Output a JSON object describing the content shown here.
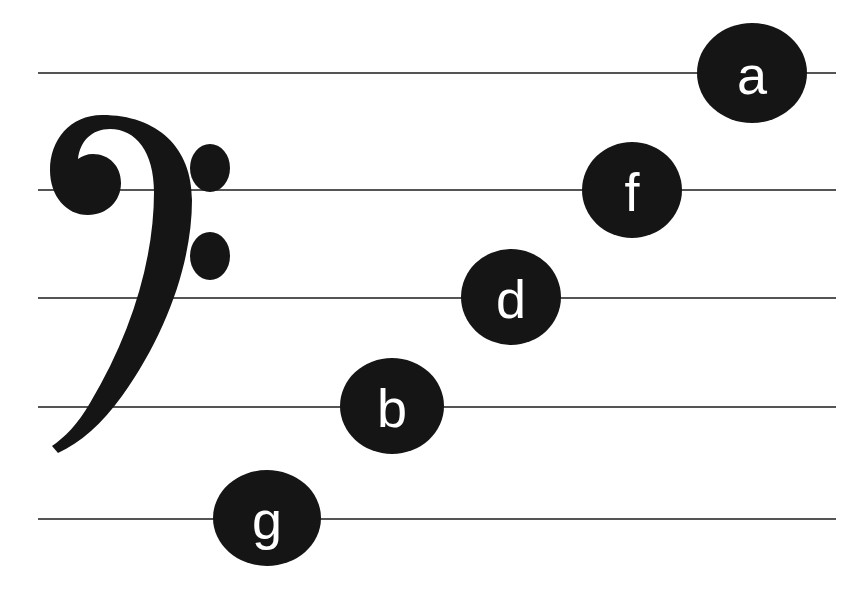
{
  "canvas": {
    "width": 865,
    "height": 604,
    "background": "#ffffff"
  },
  "staff": {
    "clef_name": "bass-clef",
    "clef_symbol": "𝄢",
    "line_color": "#555555",
    "line_left": 38,
    "line_width": 798,
    "line_thickness": 2,
    "lines": [
      {
        "name": "staff-line-1",
        "y": 72
      },
      {
        "name": "staff-line-2",
        "y": 189
      },
      {
        "name": "staff-line-3",
        "y": 297
      },
      {
        "name": "staff-line-4",
        "y": 406
      },
      {
        "name": "staff-line-5",
        "y": 518
      }
    ]
  },
  "notes": [
    {
      "label": "a",
      "cx": 752,
      "cy": 73,
      "rx": 55,
      "ry": 50,
      "line": 1,
      "color": "#151515",
      "label_color": "#ffffff"
    },
    {
      "label": "f",
      "cx": 632,
      "cy": 190,
      "rx": 50,
      "ry": 48,
      "line": 2,
      "color": "#151515",
      "label_color": "#ffffff"
    },
    {
      "label": "d",
      "cx": 511,
      "cy": 297,
      "rx": 50,
      "ry": 48,
      "line": 3,
      "color": "#151515",
      "label_color": "#ffffff"
    },
    {
      "label": "b",
      "cx": 392,
      "cy": 406,
      "rx": 52,
      "ry": 48,
      "line": 4,
      "color": "#151515",
      "label_color": "#ffffff"
    },
    {
      "label": "g",
      "cx": 267,
      "cy": 518,
      "rx": 54,
      "ry": 48,
      "line": 5,
      "color": "#151515",
      "label_color": "#ffffff"
    }
  ]
}
